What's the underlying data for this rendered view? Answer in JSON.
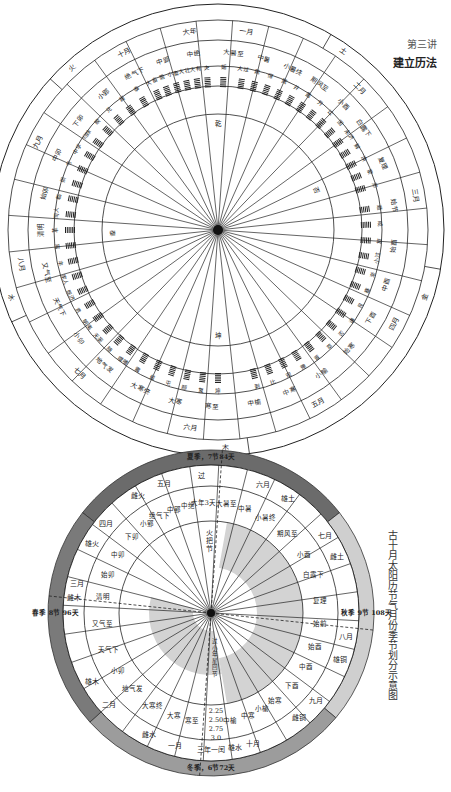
{
  "header": {
    "chapter": "第三讲",
    "title": "建立历法"
  },
  "diagram_top": {
    "center": [
      218,
      230
    ],
    "radii": [
      226,
      210,
      190,
      164,
      144,
      116
    ],
    "spoke_count": 36,
    "elements": [
      {
        "label": "土",
        "angle": 35
      },
      {
        "label": "金",
        "angle": 108
      },
      {
        "label": "木",
        "angle": 178
      },
      {
        "label": "水",
        "angle": 252
      },
      {
        "label": "火",
        "angle": 318
      }
    ],
    "months": [
      {
        "label": "一月",
        "angle": 8
      },
      {
        "label": "二月",
        "angle": 45
      },
      {
        "label": "三月",
        "angle": 80
      },
      {
        "label": "四月",
        "angle": 118
      },
      {
        "label": "五月",
        "angle": 150
      },
      {
        "label": "六月",
        "angle": 188
      },
      {
        "label": "七月",
        "angle": 224
      },
      {
        "label": "八月",
        "angle": 260
      },
      {
        "label": "九月",
        "angle": 296
      },
      {
        "label": "十月",
        "angle": 332
      },
      {
        "label": "大年",
        "angle": 352
      }
    ],
    "solar_terms": [
      {
        "label": "大暑至",
        "angle": 5
      },
      {
        "label": "中暑",
        "angle": 15
      },
      {
        "label": "小暑终",
        "angle": 25
      },
      {
        "label": "期风至",
        "angle": 35
      },
      {
        "label": "小酉",
        "angle": 45
      },
      {
        "label": "白露下",
        "angle": 55
      },
      {
        "label": "复理",
        "angle": 68
      },
      {
        "label": "始节",
        "angle": 82
      },
      {
        "label": "始酉",
        "angle": 95
      },
      {
        "label": "中酉",
        "angle": 108
      },
      {
        "label": "下酉",
        "angle": 120
      },
      {
        "label": "始寒",
        "angle": 132
      },
      {
        "label": "小榆",
        "angle": 144
      },
      {
        "label": "中寒",
        "angle": 156
      },
      {
        "label": "中榆",
        "angle": 168
      },
      {
        "label": "寒至",
        "angle": 182
      },
      {
        "label": "大寒",
        "angle": 194
      },
      {
        "label": "大寒终",
        "angle": 206
      },
      {
        "label": "地气发",
        "angle": 220
      },
      {
        "label": "小卯",
        "angle": 232
      },
      {
        "label": "天气下",
        "angle": 244
      },
      {
        "label": "又气至",
        "angle": 256
      },
      {
        "label": "清明",
        "angle": 270
      },
      {
        "label": "始卯",
        "angle": 282
      },
      {
        "label": "中卯",
        "angle": 295
      },
      {
        "label": "下卯",
        "angle": 308
      },
      {
        "label": "小郢",
        "angle": 320
      },
      {
        "label": "绝气下",
        "angle": 332
      },
      {
        "label": "中郢",
        "angle": 342
      },
      {
        "label": "中绝",
        "angle": 352
      }
    ],
    "hexagrams": [
      {
        "label": "姤",
        "angle": 2
      },
      {
        "label": "大过",
        "angle": 9
      },
      {
        "label": "鼎",
        "angle": 14
      },
      {
        "label": "恒",
        "angle": 19
      },
      {
        "label": "巽",
        "angle": 24
      },
      {
        "label": "井",
        "angle": 29
      },
      {
        "label": "蛊",
        "angle": 34
      },
      {
        "label": "升",
        "angle": 39
      },
      {
        "label": "讼",
        "angle": 44
      },
      {
        "label": "困",
        "angle": 49
      },
      {
        "label": "未济",
        "angle": 54
      },
      {
        "label": "解",
        "angle": 59
      },
      {
        "label": "涣",
        "angle": 64
      },
      {
        "label": "蒙",
        "angle": 69
      },
      {
        "label": "师",
        "angle": 74
      },
      {
        "label": "遁",
        "angle": 82
      },
      {
        "label": "咸",
        "angle": 88
      },
      {
        "label": "旅",
        "angle": 94
      },
      {
        "label": "小过",
        "angle": 100
      },
      {
        "label": "渐",
        "angle": 106
      },
      {
        "label": "蹇",
        "angle": 112
      },
      {
        "label": "艮",
        "angle": 118
      },
      {
        "label": "谦",
        "angle": 124
      },
      {
        "label": "否",
        "angle": 130
      },
      {
        "label": "萃",
        "angle": 136
      },
      {
        "label": "晋",
        "angle": 142
      },
      {
        "label": "豫",
        "angle": 148
      },
      {
        "label": "观",
        "angle": 154
      },
      {
        "label": "比",
        "angle": 160
      },
      {
        "label": "剥",
        "angle": 166
      },
      {
        "label": "坤",
        "angle": 180
      },
      {
        "label": "复",
        "angle": 186
      },
      {
        "label": "颐",
        "angle": 192
      },
      {
        "label": "屯",
        "angle": 198
      },
      {
        "label": "益",
        "angle": 204
      },
      {
        "label": "震",
        "angle": 210
      },
      {
        "label": "噬嗑",
        "angle": 216
      },
      {
        "label": "随",
        "angle": 222
      },
      {
        "label": "无妄",
        "angle": 228
      },
      {
        "label": "明夷",
        "angle": 234
      },
      {
        "label": "贲",
        "angle": 240
      },
      {
        "label": "既济",
        "angle": 246
      },
      {
        "label": "家人",
        "angle": 252
      },
      {
        "label": "丰",
        "angle": 258
      },
      {
        "label": "离",
        "angle": 264
      },
      {
        "label": "革",
        "angle": 270
      },
      {
        "label": "同人",
        "angle": 276
      },
      {
        "label": "临",
        "angle": 282
      },
      {
        "label": "损",
        "angle": 288
      },
      {
        "label": "节",
        "angle": 294
      },
      {
        "label": "中孚",
        "angle": 300
      },
      {
        "label": "归妹",
        "angle": 306
      },
      {
        "label": "睽",
        "angle": 312
      },
      {
        "label": "兑",
        "angle": 318
      },
      {
        "label": "履",
        "angle": 324
      },
      {
        "label": "泰",
        "angle": 330
      },
      {
        "label": "大畜",
        "angle": 336
      },
      {
        "label": "需",
        "angle": 340
      },
      {
        "label": "小畜",
        "angle": 344
      },
      {
        "label": "大壮",
        "angle": 348
      },
      {
        "label": "大有",
        "angle": 352
      },
      {
        "label": "夬",
        "angle": 356
      }
    ],
    "inner_marks": [
      {
        "label": "乾",
        "angle": 0
      },
      {
        "label": "否",
        "angle": 68
      },
      {
        "label": "坤",
        "angle": 180
      },
      {
        "label": "泰",
        "angle": 268
      }
    ]
  },
  "diagram_bottom": {
    "center": [
      211,
      613
    ],
    "radii": [
      163,
      148,
      127,
      92,
      56
    ],
    "seasons": [
      {
        "label": "夏季，7节84天",
        "angle": 0,
        "color": "#6b6b6b"
      },
      {
        "label": "秋季 9节 108天",
        "angle": 90,
        "color": "#cfcfcf"
      },
      {
        "label": "冬季，6节72天",
        "angle": 180,
        "color": "#9c9c9c"
      },
      {
        "label": "春季 8节 96天",
        "angle": 270,
        "color": "#7a7a7a"
      }
    ],
    "months": [
      {
        "label": "五月",
        "angle": 340
      },
      {
        "label": "雌火",
        "angle": 328
      },
      {
        "label": "六月",
        "angle": 22
      },
      {
        "label": "雄土",
        "angle": 34
      },
      {
        "label": "七月",
        "angle": 56
      },
      {
        "label": "雌土",
        "angle": 66
      },
      {
        "label": "八月",
        "angle": 100
      },
      {
        "label": "雄铜",
        "angle": 110
      },
      {
        "label": "九月",
        "angle": 130
      },
      {
        "label": "雌铜",
        "angle": 140
      },
      {
        "label": "十月",
        "angle": 162
      },
      {
        "label": "雄水",
        "angle": 170
      },
      {
        "label": "三年一闰",
        "angle": 180
      },
      {
        "label": "一月",
        "angle": 195
      },
      {
        "label": "雌水",
        "angle": 207
      },
      {
        "label": "二月",
        "angle": 228
      },
      {
        "label": "雄木",
        "angle": 240
      },
      {
        "label": "雌木",
        "angle": 276
      },
      {
        "label": "三月",
        "angle": 282
      },
      {
        "label": "雄火",
        "angle": 300
      },
      {
        "label": "四月",
        "angle": 310
      },
      {
        "label": "过",
        "angle": 356
      }
    ],
    "solar_terms": [
      {
        "label": "大年3天",
        "angle": 356
      },
      {
        "label": "大暑至",
        "angle": 8
      },
      {
        "label": "中暑",
        "angle": 18
      },
      {
        "label": "小暑终",
        "angle": 30
      },
      {
        "label": "期风至",
        "angle": 44
      },
      {
        "label": "小酉",
        "angle": 58
      },
      {
        "label": "白露下",
        "angle": 70
      },
      {
        "label": "复理",
        "angle": 84
      },
      {
        "label": "始前",
        "angle": 96
      },
      {
        "label": "始酉",
        "angle": 108
      },
      {
        "label": "中酉",
        "angle": 120
      },
      {
        "label": "下酉",
        "angle": 132
      },
      {
        "label": "始寒",
        "angle": 144
      },
      {
        "label": "小榆",
        "angle": 152
      },
      {
        "label": "中寒",
        "angle": 160
      },
      {
        "label": "中榆",
        "angle": 170
      },
      {
        "label": "寒至",
        "angle": 190
      },
      {
        "label": "大寒",
        "angle": 200
      },
      {
        "label": "大寒终",
        "angle": 212
      },
      {
        "label": "地气发",
        "angle": 226
      },
      {
        "label": "小卯",
        "angle": 238
      },
      {
        "label": "天气下",
        "angle": 250
      },
      {
        "label": "又气至",
        "angle": 264
      },
      {
        "label": "清明",
        "angle": 278
      },
      {
        "label": "始卯",
        "angle": 290
      },
      {
        "label": "中卯",
        "angle": 302
      },
      {
        "label": "下卯",
        "angle": 314
      },
      {
        "label": "小郢",
        "angle": 324
      },
      {
        "label": "绝气下",
        "angle": 332
      },
      {
        "label": "中郢",
        "angle": 340
      },
      {
        "label": "中绝",
        "angle": 348
      }
    ],
    "center_labels": {
      "top": "火把节",
      "bottom": "过小年星回节"
    },
    "leap_values": [
      "2.25",
      "2.50",
      "2.75",
      "3.0"
    ],
    "spiral_fill": "#d3d3d3"
  },
  "caption": "古十月太阳历节气月份季节划分示意图"
}
